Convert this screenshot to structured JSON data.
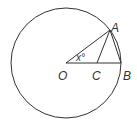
{
  "diagram": {
    "type": "geometry",
    "stroke_color": "#333333",
    "circle": {
      "center": "O",
      "cx": 66,
      "cy": 63,
      "r": 55
    },
    "points": {
      "O": {
        "label": "O",
        "x": 66,
        "y": 63
      },
      "A": {
        "label": "A",
        "x": 110,
        "y": 30
      },
      "B": {
        "label": "B",
        "x": 121,
        "y": 63
      },
      "C": {
        "label": "C",
        "x": 97,
        "y": 63
      }
    },
    "segments": [
      "OA",
      "OB",
      "AC",
      "AB"
    ],
    "angle_label": "x°",
    "angle_at": "O"
  }
}
